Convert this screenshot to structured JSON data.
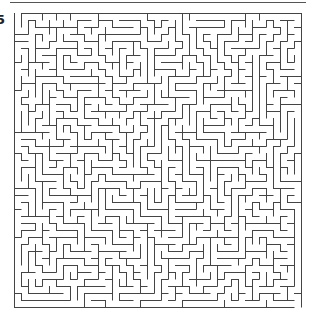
{
  "page": {
    "puzzle_number": "5"
  },
  "maze": {
    "cols": 41,
    "rows": 42,
    "cell_size": 7,
    "origin_x": 14,
    "origin_y": 13,
    "wall_color": "#444444",
    "wall_width": 1,
    "seed": 20517,
    "entrance": {
      "col": 0,
      "row": 0,
      "side": "top"
    },
    "exit": {
      "col": 40,
      "row": 41,
      "side": "bottom"
    }
  }
}
